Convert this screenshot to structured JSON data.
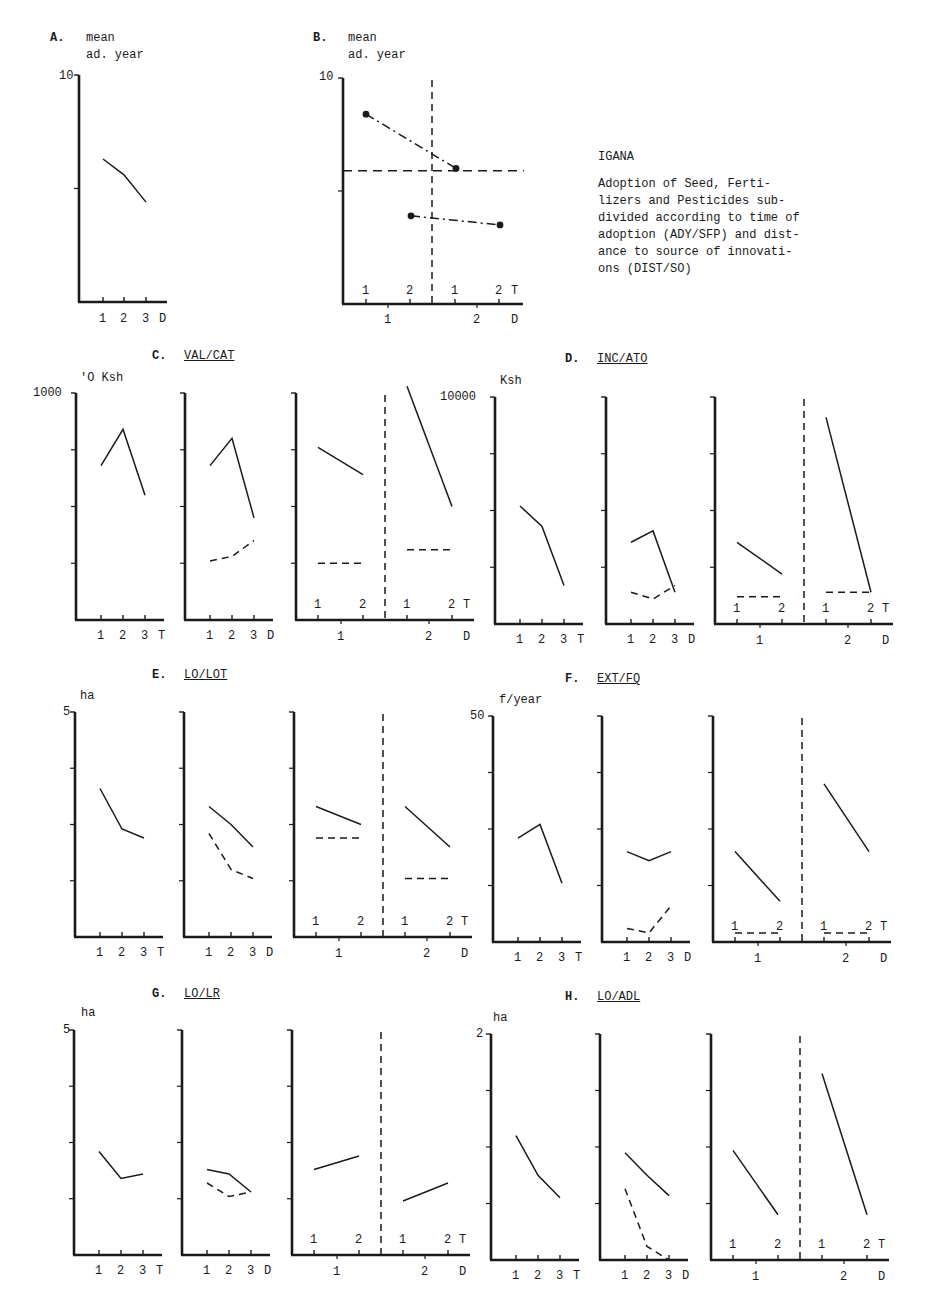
{
  "caption": {
    "location": "IGANA",
    "lines": [
      "Adoption of Seed, Ferti-",
      "lizers and Pesticides sub-",
      "divided according to time of",
      "adoption (ADY/SFP) and dist-",
      "ance to source of innovati-",
      "ons (DIST/SO)"
    ]
  },
  "chart_data": [
    {
      "id": "A",
      "letter": "A.",
      "type": "line",
      "title": "",
      "ylabel": "mean ad. year",
      "ylabel_lines": [
        "mean",
        "ad. year"
      ],
      "ymax_label": "10",
      "ylim": [
        0,
        10
      ],
      "xlabel": "D",
      "categories": [
        "1",
        "2",
        "3"
      ],
      "series": [
        {
          "name": "all adopters",
          "style": "solid",
          "values": [
            6.3,
            5.6,
            4.4
          ]
        }
      ]
    },
    {
      "id": "B",
      "letter": "B.",
      "type": "line",
      "ylabel": "mean ad. year",
      "ylabel_lines": [
        "mean",
        "ad. year"
      ],
      "ymax_label": "10",
      "ylim": [
        0,
        10
      ],
      "xlabel_T": "T",
      "xlabel_D": "D",
      "T_ticks": [
        "1",
        "2",
        "1",
        "2"
      ],
      "D_ticks": [
        "1",
        "2"
      ],
      "reference_line_y": 5.9,
      "series": [
        {
          "name": "T=1 (D=1 to D=2)",
          "style": "dash-dot-markers",
          "values": [
            8.4,
            6.0
          ]
        },
        {
          "name": "T=2 (D=1 to D=2)",
          "style": "dash-dot-markers",
          "values": [
            3.9,
            3.5
          ]
        }
      ]
    },
    {
      "id": "C",
      "letter": "C.",
      "title": "VAL/CAT",
      "type": "line",
      "ylabel": "'O Ksh",
      "ymax_label": "1000",
      "ylim": [
        0,
        1000
      ],
      "panels": [
        {
          "xlabel": "T",
          "categories": [
            "1",
            "2",
            "3"
          ],
          "series": [
            {
              "style": "solid",
              "values": [
                680,
                840,
                550
              ]
            }
          ]
        },
        {
          "xlabel": "D",
          "categories": [
            "1",
            "2",
            "3"
          ],
          "series": [
            {
              "style": "solid",
              "values": [
                680,
                800,
                450
              ]
            },
            {
              "style": "dashed",
              "values": [
                260,
                280,
                350
              ]
            }
          ]
        },
        {
          "xlabel_T": "T",
          "xlabel_D": "D",
          "T_ticks": [
            "1",
            "2",
            "1",
            "2"
          ],
          "D_ticks": [
            "1",
            "2"
          ],
          "series": [
            {
              "group": "D1",
              "style": "solid",
              "values": [
                760,
                640
              ]
            },
            {
              "group": "D1",
              "style": "dashed",
              "values": [
                250,
                250
              ]
            },
            {
              "group": "D2",
              "style": "solid",
              "values": [
                1030,
                500
              ]
            },
            {
              "group": "D2",
              "style": "dashed",
              "values": [
                310,
                310
              ]
            }
          ]
        }
      ]
    },
    {
      "id": "D",
      "letter": "D.",
      "title": "INC/ATO",
      "type": "line",
      "ylabel": "Ksh",
      "ymax_label": "10000",
      "ylim": [
        0,
        10000
      ],
      "panels": [
        {
          "xlabel": "T",
          "categories": [
            "1",
            "2",
            "3"
          ],
          "series": [
            {
              "style": "solid",
              "values": [
                5200,
                4300,
                1700
              ]
            }
          ]
        },
        {
          "xlabel": "D",
          "categories": [
            "1",
            "2",
            "3"
          ],
          "series": [
            {
              "style": "solid",
              "values": [
                3600,
                4100,
                1400
              ]
            },
            {
              "style": "dashed",
              "values": [
                1400,
                1100,
                1700
              ]
            }
          ]
        },
        {
          "xlabel_T": "T",
          "xlabel_D": "D",
          "T_ticks": [
            "1",
            "2",
            "1",
            "2"
          ],
          "D_ticks": [
            "1",
            "2"
          ],
          "series": [
            {
              "group": "D1",
              "style": "solid",
              "values": [
                3600,
                2200
              ]
            },
            {
              "group": "D1",
              "style": "dashed",
              "values": [
                1200,
                1200
              ]
            },
            {
              "group": "D2",
              "style": "solid",
              "values": [
                9100,
                1400
              ]
            },
            {
              "group": "D2",
              "style": "dashed",
              "values": [
                1400,
                1400
              ]
            }
          ]
        }
      ]
    },
    {
      "id": "E",
      "letter": "E.",
      "title": "LO/LOT",
      "type": "line",
      "ylabel": "ha",
      "ymax_label": "5",
      "ylim": [
        0,
        5
      ],
      "panels": [
        {
          "xlabel": "T",
          "categories": [
            "1",
            "2",
            "3"
          ],
          "series": [
            {
              "style": "solid",
              "values": [
                3.3,
                2.4,
                2.2
              ]
            }
          ]
        },
        {
          "xlabel": "D",
          "categories": [
            "1",
            "2",
            "3"
          ],
          "series": [
            {
              "style": "solid",
              "values": [
                2.9,
                2.5,
                2.0
              ]
            },
            {
              "style": "dashed",
              "values": [
                2.3,
                1.5,
                1.3
              ]
            }
          ]
        },
        {
          "xlabel_T": "T",
          "xlabel_D": "D",
          "T_ticks": [
            "1",
            "2",
            "1",
            "2"
          ],
          "D_ticks": [
            "1",
            "2"
          ],
          "series": [
            {
              "group": "D1",
              "style": "solid",
              "values": [
                2.9,
                2.5
              ]
            },
            {
              "group": "D1",
              "style": "dashed",
              "values": [
                2.2,
                2.2
              ]
            },
            {
              "group": "D2",
              "style": "solid",
              "values": [
                2.9,
                2.0
              ]
            },
            {
              "group": "D2",
              "style": "dashed",
              "values": [
                1.3,
                1.3
              ]
            }
          ]
        }
      ]
    },
    {
      "id": "F",
      "letter": "F.",
      "title": "EXT/FQ",
      "type": "line",
      "ylabel": "f/year",
      "ymax_label": "50",
      "ylim": [
        0,
        50
      ],
      "panels": [
        {
          "xlabel": "T",
          "categories": [
            "1",
            "2",
            "3"
          ],
          "series": [
            {
              "style": "solid",
              "values": [
                23,
                26,
                13
              ]
            }
          ]
        },
        {
          "xlabel": "D",
          "categories": [
            "1",
            "2",
            "3"
          ],
          "series": [
            {
              "style": "solid",
              "values": [
                20,
                18,
                20
              ]
            },
            {
              "style": "dashed",
              "values": [
                3,
                2,
                8
              ]
            }
          ]
        },
        {
          "xlabel_T": "T",
          "xlabel_D": "D",
          "T_ticks": [
            "1",
            "2",
            "1",
            "2"
          ],
          "D_ticks": [
            "1",
            "2"
          ],
          "series": [
            {
              "group": "D1",
              "style": "solid",
              "values": [
                20,
                9
              ]
            },
            {
              "group": "D1",
              "style": "dashed",
              "values": [
                2,
                2
              ]
            },
            {
              "group": "D2",
              "style": "solid",
              "values": [
                35,
                20
              ]
            },
            {
              "group": "D2",
              "style": "dashed",
              "values": [
                2,
                2
              ]
            }
          ]
        }
      ]
    },
    {
      "id": "G",
      "letter": "G.",
      "title": "LO/LR",
      "type": "line",
      "ylabel": "ha",
      "ymax_label": "5",
      "ylim": [
        0,
        5
      ],
      "panels": [
        {
          "xlabel": "T",
          "categories": [
            "1",
            "2",
            "3"
          ],
          "series": [
            {
              "style": "solid",
              "values": [
                2.3,
                1.7,
                1.8
              ]
            }
          ]
        },
        {
          "xlabel": "D",
          "categories": [
            "1",
            "2",
            "3"
          ],
          "series": [
            {
              "style": "solid",
              "values": [
                1.9,
                1.8,
                1.4
              ]
            },
            {
              "style": "dashed",
              "values": [
                1.6,
                1.3,
                1.4
              ]
            }
          ]
        },
        {
          "xlabel_T": "T",
          "xlabel_D": "D",
          "T_ticks": [
            "1",
            "2",
            "1",
            "2"
          ],
          "D_ticks": [
            "1",
            "2"
          ],
          "series": [
            {
              "group": "D1",
              "style": "solid",
              "values": [
                1.9,
                2.2
              ]
            },
            {
              "group": "D1",
              "style": "dashed",
              "values": []
            },
            {
              "group": "D2",
              "style": "solid",
              "values": [
                1.2,
                1.6
              ]
            },
            {
              "group": "D2",
              "style": "dashed",
              "values": []
            }
          ]
        }
      ]
    },
    {
      "id": "H",
      "letter": "H.",
      "title": "LO/ADL",
      "type": "line",
      "ylabel": "ha",
      "ymax_label": "2",
      "ylim": [
        0,
        2
      ],
      "panels": [
        {
          "xlabel": "T",
          "categories": [
            "1",
            "2",
            "3"
          ],
          "series": [
            {
              "style": "solid",
              "values": [
                1.1,
                0.75,
                0.55
              ]
            }
          ]
        },
        {
          "xlabel": "D",
          "categories": [
            "1",
            "2",
            "3"
          ],
          "series": [
            {
              "style": "solid",
              "values": [
                0.95,
                0.75,
                0.57
              ]
            },
            {
              "style": "dashed",
              "values": [
                0.63,
                0.12,
                0.0
              ]
            }
          ]
        },
        {
          "xlabel_T": "T",
          "xlabel_D": "D",
          "T_ticks": [
            "1",
            "2",
            "1",
            "2"
          ],
          "D_ticks": [
            "1",
            "2"
          ],
          "series": [
            {
              "group": "D1",
              "style": "solid",
              "values": [
                0.97,
                0.4
              ]
            },
            {
              "group": "D1",
              "style": "dashed",
              "values": []
            },
            {
              "group": "D2",
              "style": "solid",
              "values": [
                1.65,
                0.4
              ]
            },
            {
              "group": "D2",
              "style": "dashed",
              "values": []
            }
          ]
        }
      ]
    }
  ]
}
